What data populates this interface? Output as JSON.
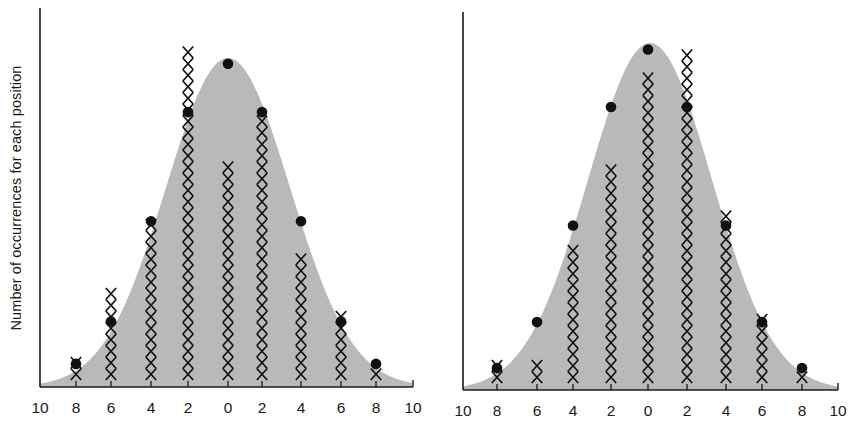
{
  "chart_data": [
    {
      "type": "scatter",
      "title": "",
      "panel": "left",
      "ylabel": "Number of occurrences for each position",
      "xlabel": "",
      "x_tick_labels": [
        "10",
        "8",
        "6",
        "4",
        "2",
        "0",
        "2",
        "4",
        "6",
        "8",
        "10"
      ],
      "positions": [
        -8,
        -6,
        -4,
        -2,
        0,
        2,
        4,
        6,
        8
      ],
      "series": [
        {
          "name": "observed (X marks)",
          "marker": "x-stack",
          "values": [
            2,
            8,
            14,
            29,
            19,
            23,
            11,
            6,
            1
          ]
        },
        {
          "name": "expected (dots)",
          "marker": "dot",
          "values": [
            1.4,
            5.1,
            13.8,
            23.3,
            27.5,
            23.3,
            13.8,
            5.1,
            1.4
          ]
        }
      ],
      "background_curve": "normal distribution (gray filled bell curve)",
      "grid": false,
      "legend": "none"
    },
    {
      "type": "scatter",
      "title": "",
      "panel": "right",
      "ylabel": "",
      "xlabel": "",
      "x_tick_labels": [
        "10",
        "8",
        "6",
        "4",
        "2",
        "0",
        "2",
        "4",
        "6",
        "8",
        "10"
      ],
      "positions": [
        -8,
        -6,
        -4,
        -2,
        0,
        2,
        4,
        6,
        8
      ],
      "series": [
        {
          "name": "observed (X marks)",
          "marker": "x-stack",
          "values": [
            2,
            2,
            12,
            19,
            27,
            29,
            15,
            6,
            1
          ]
        },
        {
          "name": "expected (dots)",
          "marker": "dot",
          "values": [
            1.3,
            5.3,
            13.7,
            24,
            29,
            24,
            13.7,
            5.3,
            1.3
          ]
        }
      ],
      "background_curve": "normal distribution (gray filled bell curve)",
      "grid": false,
      "legend": "none"
    }
  ],
  "style": {
    "curve_fill": "#b9b9b9",
    "ink": "#111111",
    "axis": "#1a1a1a"
  },
  "layout": {
    "x_unit_px": 11.5,
    "panels": [
      {
        "axis_x0": 40,
        "axis_x1": 413,
        "baseline_y": 387,
        "axis_top": 8,
        "x_bottom": 380,
        "tick_x": [
          40,
          76,
          111,
          151,
          188,
          228,
          262,
          301,
          341,
          376,
          413
        ],
        "label_y": 413,
        "curve_center": 228,
        "curve_sigma": 62,
        "curve_peak_y": 58
      },
      {
        "axis_x0": 463,
        "axis_x1": 838,
        "baseline_y": 390,
        "axis_top": 12,
        "x_bottom": 383,
        "tick_x": [
          463,
          497,
          537,
          573,
          611,
          648,
          687,
          726,
          762,
          802,
          838
        ],
        "label_y": 416,
        "curve_center": 650,
        "curve_sigma": 62,
        "curve_peak_y": 43
      }
    ]
  }
}
